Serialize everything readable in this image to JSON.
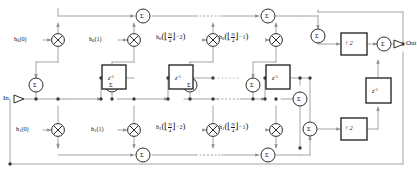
{
  "diagram": {
    "colors": {
      "line": "#9a9a9a",
      "stroke": "#2b2b2b",
      "text": "#1a1a1a",
      "background": "#ffffff"
    },
    "ports": {
      "input_label": "In",
      "output_label": "Out"
    },
    "adder_symbol": "Σ",
    "multiplier_symbol": "×",
    "delay_label": "z",
    "delay_exponent": "-1",
    "upsample_label": "2",
    "upsample_arrow": "↑",
    "ellipsis": "· · ·",
    "top_coefficients": [
      {
        "name": "h0-tap-0",
        "sub": "0",
        "arg": "0"
      },
      {
        "name": "h0-tap-1",
        "sub": "0",
        "arg": "1"
      },
      {
        "name": "h0-tap-n-2",
        "sub": "0",
        "arg": "ceilN4-2",
        "num": "N",
        "den": "4",
        "offset": "−2"
      },
      {
        "name": "h0-tap-n-1",
        "sub": "0",
        "arg": "ceilN4-1",
        "num": "N",
        "den": "4",
        "offset": "−1"
      }
    ],
    "bottom_coefficients": [
      {
        "name": "h1-tap-0",
        "sub": "1",
        "arg": "0"
      },
      {
        "name": "h1-tap-1",
        "sub": "1",
        "arg": "1"
      },
      {
        "name": "h1-tap-n-2",
        "sub": "1",
        "arg": "ceilN4-2",
        "num": "N",
        "den": "4",
        "offset": "−2"
      },
      {
        "name": "h1-tap-n-1",
        "sub": "1",
        "arg": "ceilN4-1",
        "num": "N",
        "den": "4",
        "offset": "−1"
      }
    ],
    "delay_blocks": [
      {
        "name": "delay-top-1"
      },
      {
        "name": "delay-top-2"
      },
      {
        "name": "delay-top-3"
      },
      {
        "name": "delay-top-4"
      },
      {
        "name": "delay-output"
      }
    ],
    "upsamplers": [
      {
        "name": "upsampler-upper",
        "factor": "2"
      },
      {
        "name": "upsampler-lower",
        "factor": "2"
      }
    ],
    "adders_top": [
      "sum-top-1",
      "sum-top-2",
      "sum-top-3"
    ],
    "adders_mid": [
      "sum-mid-1",
      "sum-mid-2",
      "sum-mid-3",
      "sum-mid-4",
      "sum-mid-5"
    ],
    "adders_bottom": [
      "sum-bot-1",
      "sum-bot-2",
      "sum-bot-3"
    ],
    "adders_output": [
      "sum-out-upper",
      "sum-out-lower"
    ]
  }
}
